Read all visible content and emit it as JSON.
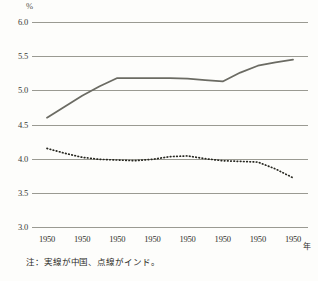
{
  "chart_data": {
    "type": "line",
    "title": "",
    "xlabel": "年",
    "ylabel": "%",
    "ylim": [
      3.0,
      6.0
    ],
    "ytick_labels": [
      "6.0",
      "5.5",
      "5.0",
      "4.5",
      "4.0",
      "3.5",
      "3.0"
    ],
    "ytick_values": [
      6.0,
      5.5,
      5.0,
      4.5,
      4.0,
      3.5,
      3.0
    ],
    "grid": true,
    "grid_axis": "y",
    "legend_position": "none",
    "annotation": "注：実線が中国、点線がインド。",
    "categories": [
      "1950",
      "1950",
      "1950",
      "1950",
      "1950",
      "1950",
      "1950",
      "1950"
    ],
    "x": [
      0,
      1,
      2,
      3,
      4,
      5,
      6,
      7
    ],
    "series": [
      {
        "name": "中国",
        "style": "solid",
        "color": "#6b6b63",
        "values": [
          4.6,
          4.9,
          5.18,
          5.18,
          5.18,
          5.13,
          5.36,
          5.45
        ]
      },
      {
        "name": "インド",
        "style": "dotted",
        "color": "#26261f",
        "values": [
          4.15,
          4.03,
          3.99,
          3.96,
          4.04,
          3.96,
          3.95,
          3.72
        ]
      }
    ],
    "series_dense": {
      "china_x": [
        0.0,
        0.5,
        1.0,
        1.5,
        2.0,
        2.5,
        3.0,
        3.5,
        4.0,
        4.5,
        5.0,
        5.5,
        6.0,
        6.5,
        7.0
      ],
      "china_y": [
        4.6,
        4.76,
        4.92,
        5.06,
        5.18,
        5.18,
        5.18,
        5.18,
        5.17,
        5.15,
        5.13,
        5.26,
        5.36,
        5.41,
        5.45
      ],
      "india_x": [
        0.0,
        0.5,
        1.0,
        1.5,
        2.0,
        2.5,
        3.0,
        3.5,
        4.0,
        4.5,
        5.0,
        5.5,
        6.0,
        6.5,
        7.0
      ],
      "india_y": [
        4.15,
        4.08,
        4.02,
        3.99,
        3.98,
        3.97,
        3.99,
        4.03,
        4.04,
        4.0,
        3.97,
        3.96,
        3.95,
        3.85,
        3.72
      ]
    }
  },
  "axis": {
    "unit_label": "%",
    "x_unit_label": "年"
  },
  "note": {
    "text": "注：実線が中国、点線がインド。"
  }
}
